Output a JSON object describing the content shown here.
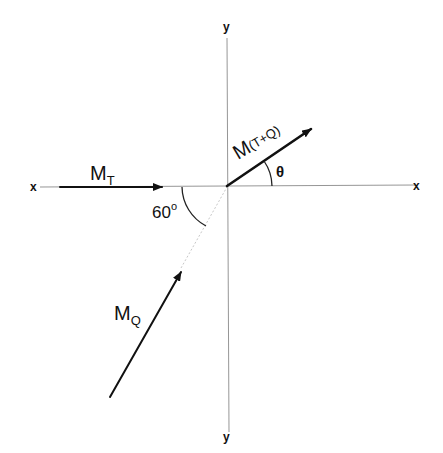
{
  "diagram": {
    "axes": {
      "x_left": "x",
      "x_right": "x",
      "y_top": "y",
      "y_bottom": "y"
    },
    "vectors": [
      {
        "id": "MT",
        "label": "M",
        "subscript": "T",
        "direction_deg": 0
      },
      {
        "id": "MQ",
        "label": "M",
        "subscript": "Q",
        "direction_deg": 60
      },
      {
        "id": "MTQ",
        "label": "M",
        "subscript": "(T+Q)",
        "direction_deg": 34
      }
    ],
    "angles": {
      "between_MT_MQ": "60",
      "degree_symbol": "o",
      "resultant_angle": "θ"
    }
  }
}
